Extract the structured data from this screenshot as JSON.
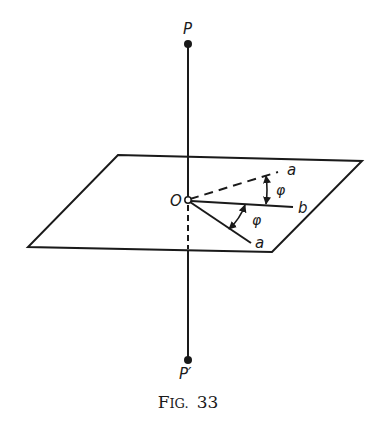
{
  "figure": {
    "caption": "FIG. 33",
    "caption_prefix_first": "F",
    "caption_prefix_rest": "IG.",
    "caption_number": "33"
  },
  "labels": {
    "point_p": "P",
    "point_p_prime": "P′",
    "origin": "O",
    "ray_a_upper": "a",
    "ray_b": "b",
    "ray_a_lower": "a",
    "angle_upper": "φ",
    "angle_lower": "φ"
  },
  "colors": {
    "ink": "#1a1a1a",
    "background": "#ffffff"
  }
}
